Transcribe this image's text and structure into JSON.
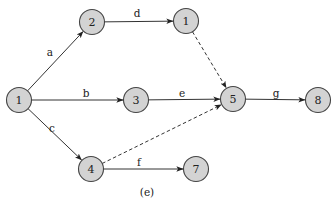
{
  "diagram": {
    "type": "activity-network",
    "caption": "(e)",
    "node_radius": 12.5,
    "colors": {
      "node_fill": "#d3d3d3",
      "node_stroke": "#444444",
      "edge": "#333333",
      "text": "#222222"
    },
    "nodes": [
      {
        "id": "n1",
        "label": "1",
        "x": 19,
        "y": 100
      },
      {
        "id": "n2",
        "label": "2",
        "x": 92,
        "y": 22
      },
      {
        "id": "n1b",
        "label": "1",
        "x": 186,
        "y": 21
      },
      {
        "id": "n3",
        "label": "3",
        "x": 136,
        "y": 100
      },
      {
        "id": "n5",
        "label": "5",
        "x": 233,
        "y": 99
      },
      {
        "id": "n8",
        "label": "8",
        "x": 318,
        "y": 100
      },
      {
        "id": "n4",
        "label": "4",
        "x": 91,
        "y": 169
      },
      {
        "id": "n7",
        "label": "7",
        "x": 196,
        "y": 169
      }
    ],
    "edges": [
      {
        "from": "n1",
        "to": "n2",
        "label": "a",
        "style": "solid",
        "lx": 50,
        "ly": 56
      },
      {
        "from": "n2",
        "to": "n1b",
        "label": "d",
        "style": "solid",
        "lx": 137,
        "ly": 17
      },
      {
        "from": "n1b",
        "to": "n5",
        "label": "",
        "style": "dashed",
        "lx": 0,
        "ly": 0
      },
      {
        "from": "n1",
        "to": "n3",
        "label": "b",
        "style": "solid",
        "lx": 86,
        "ly": 97
      },
      {
        "from": "n3",
        "to": "n5",
        "label": "e",
        "style": "solid",
        "lx": 182,
        "ly": 97
      },
      {
        "from": "n5",
        "to": "n8",
        "label": "g",
        "style": "solid",
        "lx": 276,
        "ly": 97
      },
      {
        "from": "n1",
        "to": "n4",
        "label": "c",
        "style": "solid",
        "lx": 52,
        "ly": 132
      },
      {
        "from": "n4",
        "to": "n5",
        "label": "",
        "style": "dashed",
        "lx": 0,
        "ly": 0
      },
      {
        "from": "n4",
        "to": "n7",
        "label": "f",
        "style": "solid",
        "lx": 139,
        "ly": 166
      }
    ]
  }
}
